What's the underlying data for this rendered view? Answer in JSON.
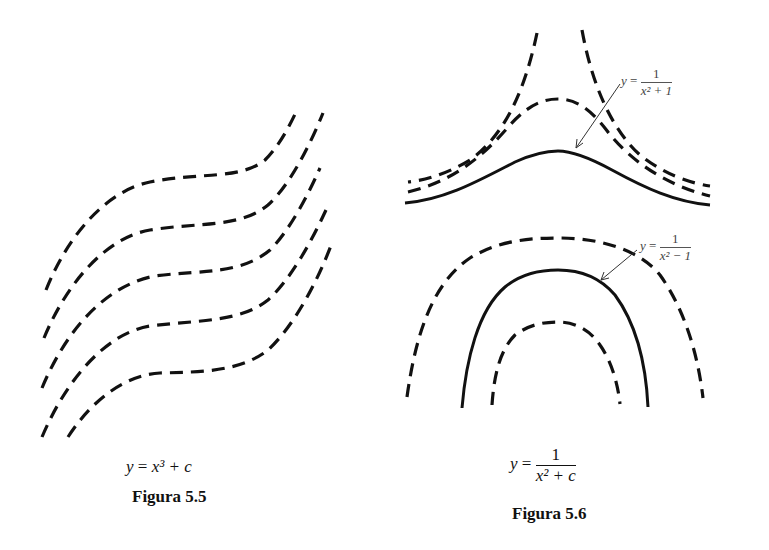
{
  "figures": [
    {
      "id": "5.5",
      "caption": "Figura 5.5",
      "equation": {
        "lhs": "y",
        "eq": "=",
        "rhs": "x³ + c"
      },
      "curves": [
        {
          "style": "dashed",
          "c": "c1"
        },
        {
          "style": "dashed",
          "c": "c2"
        },
        {
          "style": "dashed",
          "c": "c3"
        },
        {
          "style": "dashed",
          "c": "c4"
        },
        {
          "style": "dashed",
          "c": "c5"
        }
      ]
    },
    {
      "id": "5.6",
      "caption": "Figura 5.6",
      "equation": {
        "lhs": "y",
        "eq": "=",
        "numerator": "1",
        "denominator": "x² + c"
      },
      "annotations": [
        {
          "lhs": "y",
          "eq": "=",
          "numerator": "1",
          "denominator": "x² + 1",
          "points_to": "solid curve (upper family)"
        },
        {
          "lhs": "y",
          "eq": "=",
          "numerator": "1",
          "denominator": "x² − 1",
          "points_to": "solid curve (lower family)"
        }
      ]
    }
  ],
  "colors": {
    "ink": "#111111",
    "background": "#ffffff"
  }
}
